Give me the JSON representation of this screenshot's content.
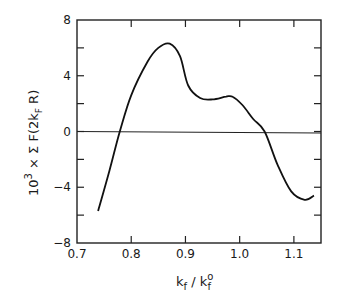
{
  "chart_data": {
    "type": "line",
    "title": "",
    "xlabel": "k_f / k_f^0",
    "ylabel": "10^3 × Σ F(2k_F R)",
    "xlim": [
      0.7,
      1.15
    ],
    "ylim": [
      -8,
      8
    ],
    "grid": false,
    "legend": null,
    "x_ticks": [
      0.7,
      0.8,
      0.9,
      1.0,
      1.1
    ],
    "x_tick_labels": [
      "0.7",
      "0.8",
      "0.9",
      "1.0",
      "1.1"
    ],
    "y_ticks": [
      -8,
      -4,
      0,
      4,
      8
    ],
    "y_tick_labels": [
      "−8",
      "−4",
      "0",
      "4",
      "8"
    ],
    "y_minor_ticks": [
      -6,
      -2,
      2,
      6
    ],
    "reference_line": {
      "y": 0
    },
    "series": [
      {
        "name": "sum F",
        "x": [
          0.739,
          0.76,
          0.779,
          0.8,
          0.83,
          0.85,
          0.871,
          0.89,
          0.905,
          0.927,
          0.95,
          0.975,
          0.987,
          1.005,
          1.025,
          1.046,
          1.07,
          1.095,
          1.12,
          1.137
        ],
        "values": [
          -5.7,
          -2.8,
          0.0,
          2.6,
          5.0,
          6.0,
          6.3,
          5.4,
          3.3,
          2.4,
          2.3,
          2.5,
          2.5,
          1.9,
          0.9,
          0.0,
          -2.4,
          -4.3,
          -4.9,
          -4.6
        ]
      }
    ]
  },
  "labels": {
    "x_axis": {
      "main": "k",
      "sub1": "f",
      "slash": " / k",
      "sup": "o",
      "sub2": "f"
    },
    "y_axis": {
      "prefix": "10",
      "exp": "3",
      "mid": " × Σ F(2k",
      "sub": "F",
      "suffix": " R)"
    }
  }
}
